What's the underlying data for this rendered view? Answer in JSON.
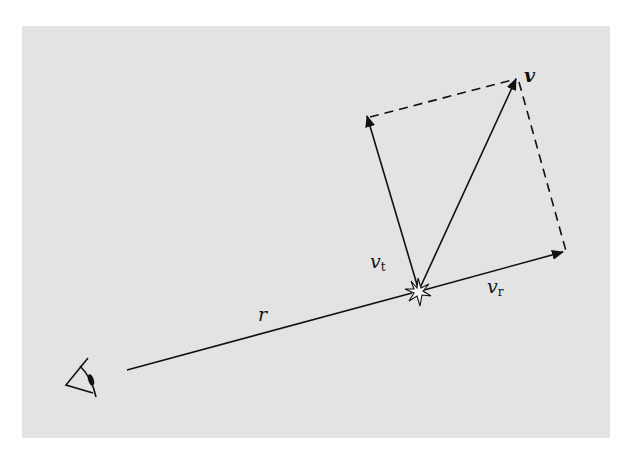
{
  "figure": {
    "background_color": "#e3e3e3",
    "line_color": "#111111",
    "labels": {
      "v": "v",
      "vt_main": "v",
      "vt_sub": "t",
      "vr_main": "v",
      "vr_sub": "r",
      "r": "r"
    },
    "elements": {
      "observer": "eye-icon",
      "source": "star-icon"
    }
  }
}
